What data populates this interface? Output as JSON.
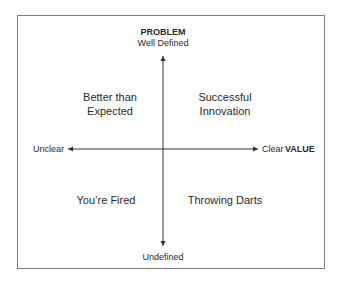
{
  "diagram": {
    "type": "2x2 matrix",
    "vertical_axis": {
      "title": "PROBLEM",
      "top_label": "Well Defined",
      "bottom_label": "Undefined"
    },
    "horizontal_axis": {
      "title": "VALUE",
      "left_label": "Unclear",
      "right_label": "Clear"
    },
    "quadrants": {
      "top_left": {
        "line1": "Better than",
        "line2": "Expected"
      },
      "top_right": {
        "line1": "Successful",
        "line2": "Innovation"
      },
      "bottom_left": {
        "line1": "You’re Fired"
      },
      "bottom_right": {
        "line1": "Throwing Darts"
      }
    },
    "colors": {
      "border": "#7a7a7a",
      "axis": "#333333",
      "text": "#2a2a2a"
    }
  }
}
